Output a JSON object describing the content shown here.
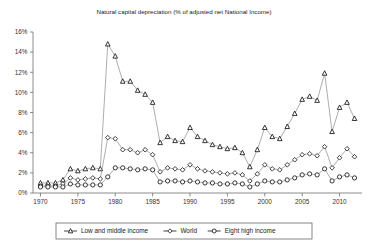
{
  "chart_data": {
    "type": "line",
    "title": "Natural capital depreciation (% of adjusted net National Income)",
    "xlabel": "",
    "ylabel": "",
    "xlim": [
      1969,
      2013
    ],
    "ylim": [
      0,
      16
    ],
    "ytick_labels": [
      "0%",
      "2%",
      "4%",
      "6%",
      "8%",
      "10%",
      "12%",
      "14%",
      "16%"
    ],
    "ytick_values": [
      0,
      2,
      4,
      6,
      8,
      10,
      12,
      14,
      16
    ],
    "xtick_labels": [
      "1970",
      "1975",
      "1980",
      "1985",
      "1990",
      "1995",
      "2000",
      "2005",
      "2010"
    ],
    "xtick_values": [
      1970,
      1975,
      1980,
      1985,
      1990,
      1995,
      2000,
      2005,
      2010
    ],
    "grid": false,
    "legend_position": "bottom",
    "x": [
      1970,
      1971,
      1972,
      1973,
      1974,
      1975,
      1976,
      1977,
      1978,
      1979,
      1980,
      1981,
      1982,
      1983,
      1984,
      1985,
      1986,
      1987,
      1988,
      1989,
      1990,
      1991,
      1992,
      1993,
      1994,
      1995,
      1996,
      1997,
      1998,
      1999,
      2000,
      2001,
      2002,
      2003,
      2004,
      2005,
      2006,
      2007,
      2008,
      2009,
      2010,
      2011,
      2012
    ],
    "series": [
      {
        "name": "Low and middle income",
        "marker": "triangle",
        "values": [
          1.0,
          1.0,
          1.0,
          1.3,
          2.4,
          2.2,
          2.4,
          2.5,
          2.4,
          14.8,
          13.6,
          11.1,
          11.1,
          10.2,
          9.8,
          9.0,
          5.0,
          5.6,
          5.2,
          5.1,
          6.5,
          5.6,
          5.2,
          4.8,
          4.6,
          4.4,
          4.5,
          4.0,
          2.6,
          4.3,
          6.5,
          5.6,
          5.4,
          6.6,
          7.9,
          9.3,
          9.6,
          9.2,
          11.9,
          6.1,
          8.5,
          9.0,
          7.4
        ]
      },
      {
        "name": "World",
        "marker": "diamond",
        "values": [
          0.7,
          0.7,
          0.7,
          0.9,
          1.5,
          1.3,
          1.4,
          1.5,
          1.4,
          5.5,
          5.4,
          4.3,
          4.3,
          4.0,
          4.3,
          3.8,
          2.1,
          2.5,
          2.4,
          2.3,
          2.8,
          2.4,
          2.2,
          2.1,
          2.0,
          1.9,
          2.0,
          1.8,
          1.2,
          1.9,
          2.8,
          2.4,
          2.3,
          2.8,
          3.3,
          3.8,
          3.9,
          3.7,
          4.6,
          2.5,
          3.5,
          4.4,
          3.6
        ]
      },
      {
        "name": "Eight high income",
        "marker": "circle",
        "values": [
          0.6,
          0.6,
          0.6,
          0.6,
          0.9,
          0.8,
          0.8,
          0.8,
          0.8,
          1.6,
          2.5,
          2.5,
          2.4,
          2.3,
          2.4,
          2.3,
          1.1,
          1.2,
          1.2,
          1.1,
          1.2,
          1.1,
          1.0,
          1.0,
          0.9,
          0.9,
          1.0,
          0.9,
          0.6,
          0.9,
          1.2,
          1.1,
          1.1,
          1.3,
          1.5,
          1.8,
          1.9,
          1.8,
          2.4,
          1.2,
          1.6,
          1.8,
          1.5
        ]
      }
    ]
  },
  "legend": {
    "items": [
      {
        "label": "Low and middle income",
        "marker": "triangle"
      },
      {
        "label": "World",
        "marker": "diamond"
      },
      {
        "label": "Eight high income",
        "marker": "circle"
      }
    ]
  }
}
